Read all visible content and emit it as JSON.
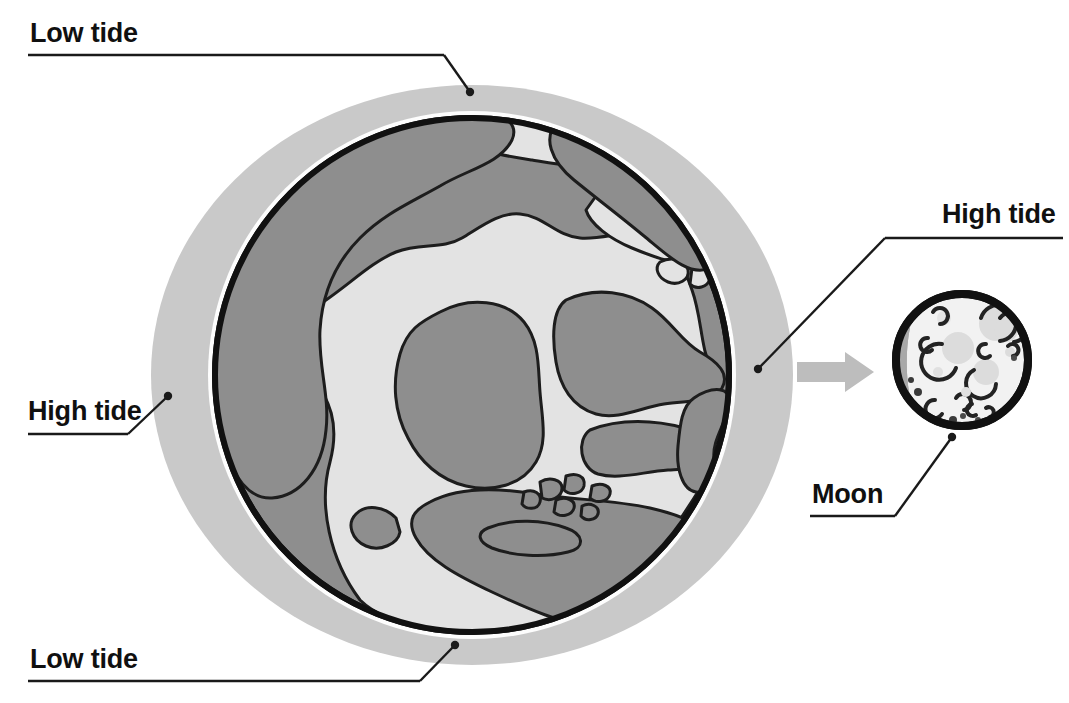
{
  "diagram": {
    "background_color": "#ffffff"
  },
  "colors": {
    "tidal_bulge": "#c9c9c9",
    "ocean": "#8e8e8e",
    "land": "#e3e3e3",
    "earth_outline": "#111111",
    "moon_light": "#f2f2f2",
    "moon_shadow": "#a8a8a8",
    "moon_crater": "#d2d2d2",
    "arrow": "#bdbdbd",
    "leader_line": "#1a1a1a",
    "text": "#101010"
  },
  "labels": [
    {
      "id": "low-tide-top",
      "text": "Low tide",
      "position": "top-left",
      "text_x": 30,
      "text_y": 42,
      "underline_x1": 28,
      "underline_x2": 444,
      "underline_y": 55,
      "leader_points": "444,55 470,92",
      "dot_x": 470,
      "dot_y": 92
    },
    {
      "id": "high-tide-left",
      "text": "High tide",
      "position": "middle-left",
      "text_x": 28,
      "text_y": 420,
      "underline_x1": 28,
      "underline_x2": 128,
      "underline_y": 434,
      "leader_points": "128,434 168,396",
      "dot_x": 168,
      "dot_y": 396
    },
    {
      "id": "low-tide-bottom",
      "text": "Low tide",
      "position": "bottom-left",
      "text_x": 30,
      "text_y": 668,
      "underline_x1": 28,
      "underline_x2": 420,
      "underline_y": 681,
      "leader_points": "420,681 455,645",
      "dot_x": 455,
      "dot_y": 645
    },
    {
      "id": "high-tide-right",
      "text": "High tide",
      "position": "right",
      "text_x": 942,
      "text_y": 223,
      "underline_x1": 885,
      "underline_x2": 1063,
      "underline_y": 238,
      "leader_points": "885,238 758,369",
      "dot_x": 758,
      "dot_y": 369
    },
    {
      "id": "moon",
      "text": "Moon",
      "position": "bottom-right",
      "text_x": 812,
      "text_y": 503,
      "underline_x1": 810,
      "underline_x2": 895,
      "underline_y": 516,
      "leader_points": "895,516 952,437",
      "dot_x": 952,
      "dot_y": 437
    }
  ],
  "earth": {
    "name": "Earth",
    "center_x": 472,
    "center_y": 375,
    "globe_radius": 260,
    "bulge_rx": 320,
    "bulge_ry": 290
  },
  "moon": {
    "name": "Moon",
    "center_x": 962,
    "center_y": 360,
    "radius": 69,
    "shadow_side": "left",
    "crater_count": 12
  },
  "arrow": {
    "name": "direction-of-moon-pull",
    "x": 797,
    "y": 358,
    "width": 75,
    "height": 28
  }
}
